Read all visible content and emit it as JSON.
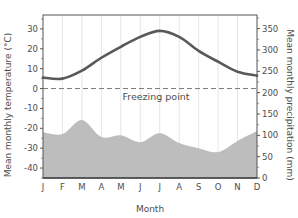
{
  "chart_data": {
    "type": "line+area",
    "title": "",
    "categories": [
      "J",
      "F",
      "M",
      "A",
      "M",
      "J",
      "J",
      "A",
      "S",
      "O",
      "N",
      "D"
    ],
    "xlabel": "Month",
    "ylabel_left": "Mean monthly temperature (°C)",
    "ylabel_right": "Mean monthly precipitation (mm)",
    "ylim_left": [
      -45,
      37
    ],
    "ylim_right": [
      0,
      382
    ],
    "yticks_left": [
      -40,
      -30,
      -20,
      -10,
      0,
      10,
      20,
      30
    ],
    "yticks_right": [
      0,
      50,
      100,
      150,
      200,
      250,
      300,
      350
    ],
    "grid": "vertical lines at each month",
    "series": [
      {
        "name": "Mean monthly temperature",
        "axis": "left",
        "style": "line",
        "color": "#595959",
        "values": [
          5.5,
          5,
          9,
          15.5,
          21,
          26,
          29,
          26,
          19,
          13.5,
          8.5,
          6.5
        ]
      },
      {
        "name": "Mean monthly precipitation",
        "axis": "right",
        "style": "area",
        "color": "#bdbdbd",
        "values": [
          107,
          103,
          136,
          96,
          100,
          84,
          105,
          82,
          70,
          61,
          87,
          110
        ]
      }
    ],
    "annotations": [
      {
        "type": "hline",
        "axis": "left",
        "value": 0,
        "style": "dashed",
        "label": "Freezing point"
      }
    ]
  }
}
